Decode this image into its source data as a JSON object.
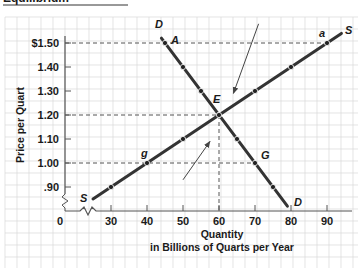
{
  "title": "Equilibrium",
  "colors": {
    "grid": "#d9d9d9",
    "axis": "#555555",
    "curve": "#333333",
    "dashed": "#555555",
    "arrow": "#444444"
  },
  "chart_data": {
    "type": "line",
    "title": "Equilibrium",
    "xlabel": "Quantity in Billions of Quarts per Year",
    "xlabel_lines": [
      "Quantity",
      "in Billions of Quarts per Year"
    ],
    "ylabel": "Price per Quart",
    "x_ticks": [
      0,
      30,
      40,
      50,
      60,
      70,
      80,
      90
    ],
    "x_tick_labels": [
      "0",
      "30",
      "40",
      "50",
      "60",
      "70",
      "80",
      "90"
    ],
    "y_ticks": [
      0.9,
      1.0,
      1.1,
      1.2,
      1.3,
      1.4,
      1.5
    ],
    "y_tick_labels": [
      ".90",
      "1.00",
      "1.10",
      "1.20",
      "1.30",
      "1.40",
      "$1.50"
    ],
    "axis_breaks": [
      "x",
      "y"
    ],
    "grid": true,
    "series": [
      {
        "name": "D",
        "label_start": "D",
        "label_end": "D",
        "line": [
          [
            44,
            1.52
          ],
          [
            79,
            0.82
          ]
        ],
        "points": [
          {
            "x": 45,
            "y": 1.5,
            "label": "A"
          },
          {
            "x": 50,
            "y": 1.4
          },
          {
            "x": 55,
            "y": 1.3
          },
          {
            "x": 60,
            "y": 1.2,
            "label": "E"
          },
          {
            "x": 65,
            "y": 1.1
          },
          {
            "x": 70,
            "y": 1.0,
            "label": "G"
          },
          {
            "x": 75,
            "y": 0.9
          }
        ]
      },
      {
        "name": "S",
        "label_start": "S",
        "label_end": "S",
        "line": [
          [
            25,
            0.85
          ],
          [
            94,
            1.54
          ]
        ],
        "points": [
          {
            "x": 30,
            "y": 0.9
          },
          {
            "x": 40,
            "y": 1.0,
            "label": "g"
          },
          {
            "x": 50,
            "y": 1.1
          },
          {
            "x": 60,
            "y": 1.2,
            "label": "E"
          },
          {
            "x": 70,
            "y": 1.3
          },
          {
            "x": 80,
            "y": 1.4
          },
          {
            "x": 90,
            "y": 1.5,
            "label": "a"
          }
        ]
      }
    ],
    "equilibrium": {
      "x": 60,
      "y": 1.2,
      "label": "E"
    },
    "reference_lines": [
      {
        "type": "horizontal",
        "y": 1.5,
        "from_x": 0,
        "to_x": 90,
        "style": "dashed"
      },
      {
        "type": "horizontal",
        "y": 1.2,
        "from_x": 0,
        "to_x": 60,
        "style": "dashed"
      },
      {
        "type": "horizontal",
        "y": 1.0,
        "from_x": 0,
        "to_x": 70,
        "style": "dashed"
      },
      {
        "type": "vertical",
        "x": 60,
        "from_y": 0,
        "to_y": 1.2,
        "style": "dashed"
      }
    ],
    "annotations": [
      {
        "type": "arrow",
        "description": "price falls toward equilibrium from surplus",
        "from": [
          71,
          1.58
        ],
        "to": [
          64,
          1.29
        ]
      },
      {
        "type": "arrow",
        "description": "price rises toward equilibrium from shortage",
        "from": [
          50,
          0.93
        ],
        "to": [
          57.5,
          1.09
        ]
      }
    ],
    "xlim": [
      0,
      97
    ],
    "ylim": [
      0.8,
      1.57
    ]
  }
}
